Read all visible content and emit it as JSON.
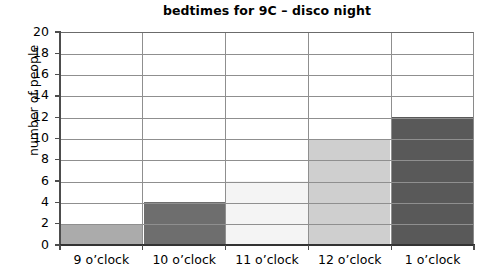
{
  "chart_data": {
    "type": "bar",
    "title": "bedtimes for 9C – disco night",
    "xlabel": "",
    "ylabel": "number of people",
    "categories": [
      "9 o’clock",
      "10 o’clock",
      "11 o’clock",
      "12 o’clock",
      "1 o’clock"
    ],
    "values": [
      2,
      4,
      6,
      10,
      12
    ],
    "bar_colors": [
      "#ababab",
      "#6e6e6e",
      "#f4f4f4",
      "#cfcfcf",
      "#595959"
    ],
    "ylim": [
      0,
      20
    ],
    "ytick_step": 2,
    "yticks": [
      0,
      2,
      4,
      6,
      8,
      10,
      12,
      14,
      16,
      18,
      20
    ],
    "ytick_labels": [
      "0",
      "2",
      "4",
      "6",
      "8",
      "10",
      "12",
      "14",
      "16",
      "18",
      "20"
    ],
    "grid": "horizontal-and-vertical",
    "legend": "none",
    "gridline_color": "#8f8f8f",
    "axis_color": "#333333",
    "background": "#ffffff"
  }
}
